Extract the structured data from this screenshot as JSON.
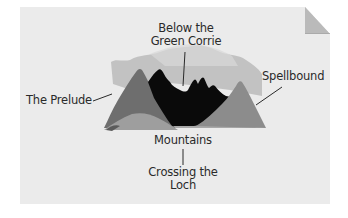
{
  "diagram": {
    "type": "labeled-illustration",
    "labels": {
      "top": {
        "line1": "Below the",
        "line2": "Green Corrie"
      },
      "left": "The Prelude",
      "right": "Spellbound",
      "center": "Mountains",
      "bottom": {
        "line1": "Crossing the",
        "line2": "Loch"
      }
    },
    "layers": [
      {
        "name": "background-clouds",
        "color": "#bdbdbd"
      },
      {
        "name": "left-peak",
        "color": "#6e6e6e"
      },
      {
        "name": "middle-range",
        "color": "#0a0a0a"
      },
      {
        "name": "right-peak",
        "color": "#8c8c8c"
      },
      {
        "name": "foreground",
        "color": "#a8a8a8"
      }
    ],
    "colors": {
      "paper": "#ebebeb",
      "ink": "#2a2a2a",
      "fold": "#b0b0b0"
    }
  }
}
